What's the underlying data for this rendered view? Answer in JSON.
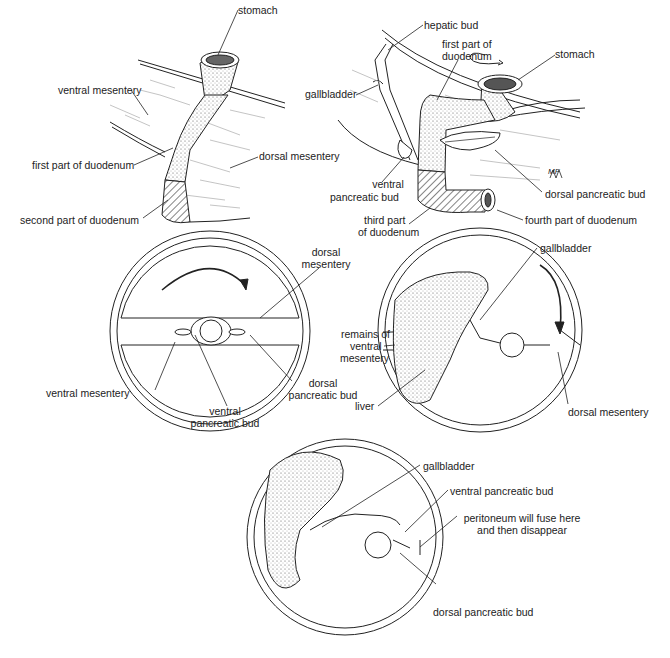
{
  "panels": {
    "top_left": {
      "labels": {
        "stomach": "stomach",
        "ventral_mesentery": "ventral mesentery",
        "first_part": "first part of duodenum",
        "dorsal_mesentery": "dorsal mesentery",
        "second_part": "second part of duodenum"
      }
    },
    "top_right": {
      "labels": {
        "hepatic_bud": "hepatic bud",
        "first_part_l1": "first part of",
        "first_part_l2": "duodenum",
        "stomach": "stomach",
        "gallbladder": "gallbladder",
        "ventral_bud_l1": "ventral",
        "ventral_bud_l2": "pancreatic bud",
        "dorsal_bud": "dorsal pancreatic bud",
        "third_part_l1": "third part",
        "third_part_l2": "of duodenum",
        "fourth_part": "fourth part of duodenum",
        "signature": "MF"
      }
    },
    "middle_left": {
      "labels": {
        "dorsal_mesentery_l1": "dorsal",
        "dorsal_mesentery_l2": "mesentery",
        "ventral_mesentery": "ventral mesentery",
        "dorsal_bud_l1": "dorsal",
        "dorsal_bud_l2": "pancreatic bud",
        "ventral_bud_l1": "ventral",
        "ventral_bud_l2": "pancreatic bud"
      }
    },
    "middle_right": {
      "labels": {
        "gallbladder": "gallbladder",
        "remains_l1": "remains of",
        "remains_l2": "ventral",
        "remains_l3": "mesentery",
        "liver": "liver",
        "dorsal_mesentery": "dorsal mesentery"
      }
    },
    "bottom": {
      "labels": {
        "gallbladder": "gallbladder",
        "ventral_bud": "ventral pancreatic bud",
        "peritoneum_l1": "peritoneum will fuse here",
        "peritoneum_l2": "and then disappear",
        "dorsal_bud": "dorsal pancreatic bud"
      }
    }
  },
  "colors": {
    "ink": "#222222",
    "background": "#ffffff"
  }
}
